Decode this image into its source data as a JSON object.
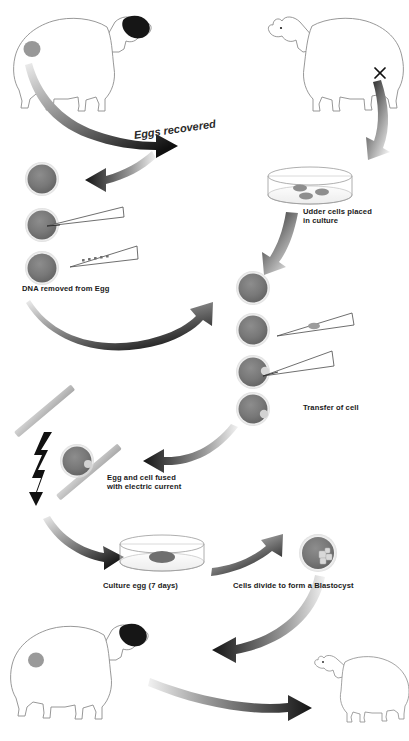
{
  "diagram": {
    "background_color": "#ffffff",
    "cell_fill": "#757575",
    "cell_stroke": "#5a5a5a",
    "outline_color": "#8a8a8a",
    "text_color": "#1a1a1a",
    "labels": {
      "eggs_recovered": "Eggs recovered",
      "udder_cells": "Udder cells placed\nin culture",
      "dna_removed": "DNA removed from Egg",
      "transfer_of_cell": "Transfer of cell",
      "egg_cell_fused": "Egg and cell fused\nwith electric current",
      "culture_egg": "Culture egg (7 days)",
      "blastocyst": "Cells divide to form a Blastocyst"
    },
    "figures": {
      "donor_sheep_top_left": "sheep-egg-donor",
      "donor_sheep_top_right": "sheep-udder-donor",
      "surrogate_sheep_bottom_left": "sheep-surrogate",
      "lamb_bottom_right": "lamb-clone",
      "petri_dish_udder": "petri-dish-udder-cells",
      "petri_dish_culture": "petri-dish-culture-egg",
      "blastocyst_cell": "blastocyst",
      "electrodes": "electrode-plates",
      "lightning": "electric-current-bolt"
    },
    "counts": {
      "eggs_left_column": 3,
      "eggs_middle_column": 4,
      "cells_in_udder_dish": 3,
      "pipettes_left": 2,
      "pipettes_middle": 2
    },
    "steps": [
      "Eggs recovered from donor sheep",
      "Udder cells placed in culture",
      "DNA removed from Egg",
      "Transfer of cell",
      "Egg and cell fused with electric current",
      "Culture egg (7 days)",
      "Cells divide to form a Blastocyst",
      "Implant into surrogate sheep",
      "Cloned lamb born"
    ]
  }
}
